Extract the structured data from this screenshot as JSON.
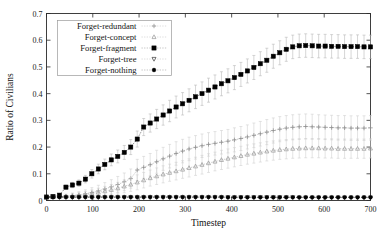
{
  "chart_data": {
    "type": "line",
    "title": "",
    "xlabel": "Timestep",
    "ylabel": "Ratio of Civilians",
    "xlim": [
      0,
      700
    ],
    "ylim": [
      0,
      0.7
    ],
    "xticks": [
      0,
      100,
      200,
      300,
      400,
      500,
      600,
      700
    ],
    "yticks": [
      0,
      0.1,
      0.2,
      0.3,
      0.4,
      0.5,
      0.6,
      0.7
    ],
    "xtick_labels": [
      "0",
      "100",
      "200",
      "300",
      "400",
      "500",
      "600",
      "700"
    ],
    "ytick_labels": [
      "0",
      "0.1",
      "0.2",
      "0.3",
      "0.4",
      "0.5",
      "0.6",
      "0.7"
    ],
    "grid": false,
    "legend_position": "upper-left",
    "errorbars": true,
    "x": [
      0,
      14,
      28,
      42,
      56,
      70,
      84,
      98,
      112,
      126,
      140,
      154,
      168,
      182,
      196,
      210,
      224,
      238,
      252,
      266,
      280,
      294,
      308,
      322,
      336,
      350,
      364,
      378,
      392,
      406,
      420,
      434,
      448,
      462,
      476,
      490,
      504,
      518,
      532,
      546,
      560,
      574,
      588,
      602,
      616,
      630,
      644,
      658,
      672,
      686,
      700
    ],
    "series": [
      {
        "name": "Forget-redundant",
        "marker": "plus",
        "color": "#8c8c8c",
        "values": [
          0.012,
          0.013,
          0.014,
          0.016,
          0.018,
          0.021,
          0.025,
          0.03,
          0.036,
          0.043,
          0.051,
          0.06,
          0.07,
          0.082,
          0.114,
          0.124,
          0.134,
          0.145,
          0.156,
          0.166,
          0.176,
          0.185,
          0.193,
          0.199,
          0.205,
          0.21,
          0.214,
          0.218,
          0.222,
          0.227,
          0.232,
          0.238,
          0.244,
          0.25,
          0.256,
          0.262,
          0.267,
          0.271,
          0.274,
          0.276,
          0.277,
          0.276,
          0.275,
          0.274,
          0.273,
          0.272,
          0.272,
          0.271,
          0.271,
          0.271,
          0.272
        ],
        "errors": [
          0.004,
          0.005,
          0.006,
          0.008,
          0.01,
          0.012,
          0.015,
          0.018,
          0.021,
          0.024,
          0.027,
          0.03,
          0.033,
          0.036,
          0.04,
          0.041,
          0.042,
          0.043,
          0.043,
          0.044,
          0.044,
          0.044,
          0.044,
          0.044,
          0.044,
          0.044,
          0.044,
          0.044,
          0.044,
          0.045,
          0.045,
          0.045,
          0.046,
          0.046,
          0.047,
          0.047,
          0.047,
          0.047,
          0.047,
          0.047,
          0.047,
          0.047,
          0.046,
          0.046,
          0.046,
          0.046,
          0.046,
          0.046,
          0.046,
          0.046,
          0.046
        ]
      },
      {
        "name": "Forget-concept",
        "marker": "triangle-up",
        "color": "#9a9a9a",
        "values": [
          0.012,
          0.013,
          0.014,
          0.015,
          0.017,
          0.019,
          0.022,
          0.026,
          0.03,
          0.035,
          0.04,
          0.046,
          0.053,
          0.06,
          0.068,
          0.076,
          0.084,
          0.091,
          0.098,
          0.104,
          0.11,
          0.116,
          0.122,
          0.128,
          0.134,
          0.14,
          0.146,
          0.152,
          0.157,
          0.162,
          0.167,
          0.172,
          0.176,
          0.18,
          0.184,
          0.187,
          0.19,
          0.192,
          0.194,
          0.195,
          0.196,
          0.196,
          0.196,
          0.195,
          0.195,
          0.194,
          0.194,
          0.194,
          0.194,
          0.194,
          0.195
        ],
        "errors": [
          0.003,
          0.004,
          0.005,
          0.006,
          0.008,
          0.01,
          0.012,
          0.014,
          0.016,
          0.018,
          0.02,
          0.022,
          0.024,
          0.026,
          0.028,
          0.029,
          0.03,
          0.031,
          0.032,
          0.032,
          0.033,
          0.033,
          0.034,
          0.034,
          0.035,
          0.035,
          0.035,
          0.036,
          0.036,
          0.036,
          0.036,
          0.036,
          0.036,
          0.036,
          0.036,
          0.036,
          0.036,
          0.036,
          0.036,
          0.036,
          0.036,
          0.036,
          0.036,
          0.036,
          0.036,
          0.036,
          0.036,
          0.036,
          0.036,
          0.036,
          0.036
        ]
      },
      {
        "name": "Forget-fragment",
        "marker": "square",
        "color": "#000000",
        "values": [
          0.013,
          0.015,
          0.02,
          0.05,
          0.058,
          0.065,
          0.08,
          0.1,
          0.118,
          0.135,
          0.152,
          0.165,
          0.18,
          0.2,
          0.23,
          0.275,
          0.29,
          0.305,
          0.32,
          0.335,
          0.35,
          0.362,
          0.375,
          0.388,
          0.4,
          0.413,
          0.425,
          0.437,
          0.448,
          0.46,
          0.472,
          0.485,
          0.498,
          0.512,
          0.525,
          0.54,
          0.553,
          0.566,
          0.575,
          0.579,
          0.58,
          0.579,
          0.578,
          0.578,
          0.577,
          0.577,
          0.576,
          0.576,
          0.576,
          0.575,
          0.575
        ],
        "errors": [
          0.004,
          0.005,
          0.006,
          0.008,
          0.01,
          0.012,
          0.014,
          0.016,
          0.018,
          0.02,
          0.022,
          0.024,
          0.026,
          0.028,
          0.03,
          0.032,
          0.034,
          0.036,
          0.038,
          0.04,
          0.041,
          0.042,
          0.043,
          0.044,
          0.044,
          0.045,
          0.045,
          0.045,
          0.045,
          0.045,
          0.045,
          0.045,
          0.045,
          0.045,
          0.045,
          0.045,
          0.045,
          0.045,
          0.044,
          0.044,
          0.044,
          0.044,
          0.044,
          0.044,
          0.044,
          0.044,
          0.044,
          0.044,
          0.044,
          0.044,
          0.044
        ]
      },
      {
        "name": "Forget-tree",
        "marker": "triangle-down",
        "color": "#3a3a3a",
        "values": [
          0.012,
          0.012,
          0.012,
          0.012,
          0.012,
          0.012,
          0.012,
          0.012,
          0.012,
          0.012,
          0.012,
          0.012,
          0.012,
          0.012,
          0.012,
          0.012,
          0.012,
          0.012,
          0.012,
          0.012,
          0.012,
          0.012,
          0.012,
          0.012,
          0.012,
          0.012,
          0.012,
          0.012,
          0.012,
          0.012,
          0.012,
          0.012,
          0.012,
          0.012,
          0.012,
          0.012,
          0.012,
          0.012,
          0.012,
          0.011,
          0.011,
          0.011,
          0.011,
          0.011,
          0.011,
          0.011,
          0.011,
          0.011,
          0.011,
          0.011,
          0.011
        ],
        "errors": [
          0.002,
          0.002,
          0.002,
          0.002,
          0.002,
          0.002,
          0.002,
          0.002,
          0.002,
          0.002,
          0.002,
          0.002,
          0.002,
          0.002,
          0.002,
          0.002,
          0.002,
          0.002,
          0.002,
          0.002,
          0.002,
          0.002,
          0.002,
          0.002,
          0.002,
          0.002,
          0.002,
          0.002,
          0.002,
          0.002,
          0.002,
          0.002,
          0.002,
          0.002,
          0.002,
          0.002,
          0.002,
          0.002,
          0.002,
          0.002,
          0.002,
          0.002,
          0.002,
          0.002,
          0.002,
          0.002,
          0.002,
          0.002,
          0.002,
          0.002,
          0.002
        ]
      },
      {
        "name": "Forget-nothing",
        "marker": "circle",
        "color": "#000000",
        "values": [
          0.013,
          0.013,
          0.013,
          0.013,
          0.013,
          0.013,
          0.013,
          0.013,
          0.013,
          0.013,
          0.013,
          0.013,
          0.013,
          0.013,
          0.013,
          0.013,
          0.013,
          0.013,
          0.013,
          0.013,
          0.013,
          0.013,
          0.013,
          0.013,
          0.013,
          0.013,
          0.013,
          0.013,
          0.012,
          0.012,
          0.012,
          0.012,
          0.012,
          0.012,
          0.012,
          0.012,
          0.012,
          0.012,
          0.012,
          0.012,
          0.012,
          0.012,
          0.012,
          0.012,
          0.012,
          0.012,
          0.012,
          0.012,
          0.012,
          0.012,
          0.012
        ],
        "errors": [
          0.002,
          0.002,
          0.002,
          0.002,
          0.002,
          0.002,
          0.002,
          0.002,
          0.002,
          0.002,
          0.002,
          0.002,
          0.002,
          0.002,
          0.002,
          0.002,
          0.002,
          0.002,
          0.002,
          0.002,
          0.002,
          0.002,
          0.002,
          0.002,
          0.002,
          0.002,
          0.002,
          0.002,
          0.002,
          0.002,
          0.002,
          0.002,
          0.002,
          0.002,
          0.002,
          0.002,
          0.002,
          0.002,
          0.002,
          0.002,
          0.002,
          0.002,
          0.002,
          0.002,
          0.002,
          0.002,
          0.002,
          0.002,
          0.002,
          0.002,
          0.002
        ]
      }
    ],
    "legend": [
      "Forget-redundant",
      "Forget-concept",
      "Forget-fragment",
      "Forget-tree",
      "Forget-nothing"
    ]
  },
  "colors": {
    "axis": "#2b2b2b",
    "background": "#ffffff",
    "legend_border": "#9a9a9a",
    "errorbar_light": "#c8c8c8"
  }
}
